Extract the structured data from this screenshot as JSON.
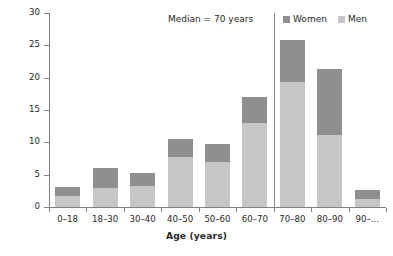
{
  "chart_data": {
    "type": "bar",
    "subtype": "stacked",
    "title": "",
    "xlabel": "Age (years)",
    "ylabel": "% of resuscitations",
    "categories": [
      "0–18",
      "18–30",
      "30–40",
      "40–50",
      "50–60",
      "60–70",
      "70–80",
      "80–90",
      "90–..."
    ],
    "series": [
      {
        "name": "Men",
        "color": "#c6c6c6",
        "values": [
          1.7,
          3.0,
          3.3,
          7.8,
          7.0,
          13.0,
          19.3,
          11.2,
          1.2
        ]
      },
      {
        "name": "Women",
        "color": "#8e8e8e",
        "values": [
          1.4,
          3.0,
          1.9,
          2.7,
          2.8,
          4.0,
          6.5,
          10.1,
          1.4
        ]
      }
    ],
    "totals": [
      3.1,
      6.0,
      5.2,
      10.5,
      9.8,
      17.0,
      25.8,
      21.3,
      2.6
    ],
    "ylim": [
      0,
      30
    ],
    "yticks": [
      0,
      5,
      10,
      15,
      20,
      25,
      30
    ],
    "ytick_labels": [
      "0",
      "5",
      "10",
      "15",
      "20",
      "25",
      "30"
    ],
    "grid": false,
    "legend_position": "top-right",
    "annotations": [
      {
        "name": "median-marker",
        "text": "Median = 70 years",
        "type": "vertical-line",
        "at_category_boundary": "60–70 / 70–80"
      }
    ]
  },
  "axes": {
    "y_title": "% of resuscitations",
    "x_title": "Age (years)"
  },
  "legend": {
    "items": [
      {
        "label": "Women",
        "color": "#8e8e8e"
      },
      {
        "label": "Men",
        "color": "#c6c6c6"
      }
    ]
  },
  "annotation": {
    "median_text": "Median = 70 years"
  },
  "colors": {
    "women": "#8e8e8e",
    "men": "#c6c6c6",
    "axis": "#808080",
    "text": "#262626",
    "background": "#ffffff"
  }
}
